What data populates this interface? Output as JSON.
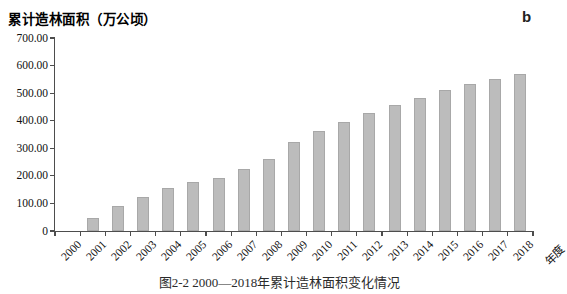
{
  "figure": {
    "panel_label": "b",
    "caption_bottom_clipped": "图2-2 2000—2018年累计造林面积变化情况"
  },
  "chart_data": {
    "type": "bar",
    "title": "",
    "xlabel": "年度",
    "ylabel": "累计造林面积（万公顷）",
    "categories": [
      "2000",
      "2001",
      "2002",
      "2003",
      "2004",
      "2005",
      "2006",
      "2007",
      "2008",
      "2009",
      "2010",
      "2011",
      "2012",
      "2013",
      "2014",
      "2015",
      "2016",
      "2017",
      "2018"
    ],
    "values": [
      0,
      47,
      92,
      123,
      157,
      178,
      194,
      224,
      262,
      322,
      362,
      394,
      428,
      456,
      484,
      512,
      534,
      552,
      570
    ],
    "ylim": [
      0,
      700
    ],
    "ytick_values": [
      700,
      600,
      500,
      400,
      300,
      200,
      100,
      0
    ],
    "ytick_labels": [
      "700.00",
      "600.00",
      "500.00",
      "400.00",
      "300.00",
      "200.00",
      "100.00",
      "0"
    ],
    "grid": false,
    "legend": "none",
    "bar_color": "#bcbcbc",
    "bar_border_color": "#a8a8a8",
    "axis_color": "#4d4d4d"
  }
}
